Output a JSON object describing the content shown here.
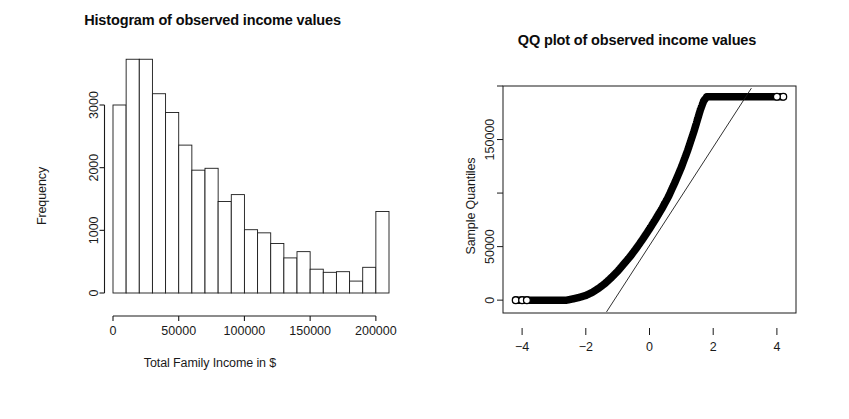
{
  "figure": {
    "background": "#ffffff",
    "foreground": "#111111",
    "panels": [
      "histogram",
      "qqplot"
    ]
  },
  "histogram": {
    "title": "Histogram of observed income values",
    "xlabel": "Total Family Income in $",
    "ylabel": "Frequency"
  },
  "qqplot": {
    "title": "QQ plot of observed income values",
    "xlabel": "Theoretical Quantiles",
    "ylabel": "Sample Quantiles"
  },
  "chart_data": [
    {
      "type": "bar",
      "id": "histogram",
      "title": "Histogram of observed income values",
      "xlabel": "Total Family Income in $",
      "ylabel": "Frequency",
      "grid": false,
      "legend": null,
      "xlim": [
        0,
        210000
      ],
      "ylim": [
        0,
        3800
      ],
      "xticks": [
        0,
        50000,
        100000,
        150000,
        200000
      ],
      "xticklabels": [
        "0",
        "50000",
        "100000",
        "150000",
        "200000"
      ],
      "yticks": [
        0,
        1000,
        2000,
        3000
      ],
      "yticklabels": [
        "0",
        "1000",
        "2000",
        "3000"
      ],
      "bin_width": 10000,
      "bin_edges": [
        0,
        10000,
        20000,
        30000,
        40000,
        50000,
        60000,
        70000,
        80000,
        90000,
        100000,
        110000,
        120000,
        130000,
        140000,
        150000,
        160000,
        170000,
        180000,
        190000,
        200000,
        210000
      ],
      "categories": [
        "0-10k",
        "10-20k",
        "20-30k",
        "30-40k",
        "40-50k",
        "50-60k",
        "60-70k",
        "70-80k",
        "80-90k",
        "90-100k",
        "100-110k",
        "110-120k",
        "120-130k",
        "130-140k",
        "140-150k",
        "150-160k",
        "160-170k",
        "170-180k",
        "180-190k",
        "190-200k",
        "200-210k"
      ],
      "values": [
        3000,
        3730,
        3730,
        3180,
        2880,
        2360,
        1960,
        1990,
        1460,
        1570,
        1010,
        960,
        790,
        560,
        660,
        380,
        330,
        340,
        190,
        410,
        1300
      ]
    },
    {
      "type": "scatter",
      "id": "qqplot",
      "title": "QQ plot of observed income values",
      "xlabel": "Theoretical Quantiles",
      "ylabel": "Sample Quantiles",
      "grid": false,
      "legend": null,
      "box": true,
      "xlim": [
        -4.6,
        4.6
      ],
      "ylim": [
        -12000,
        200000
      ],
      "xticks": [
        -4,
        -2,
        0,
        2,
        4
      ],
      "xticklabels": [
        "−4",
        "−2",
        "0",
        "2",
        "4"
      ],
      "yticks": [
        0,
        50000,
        100000,
        150000,
        200000
      ],
      "yticklabels": [
        "0",
        "50000",
        "",
        "150000",
        ""
      ],
      "reference_line": {
        "x": [
          -1.35,
          3.2
        ],
        "y": [
          -11000,
          198000
        ],
        "slope": 45900,
        "intercept": 50900
      },
      "series": [
        {
          "name": "Sample vs Theoretical quantiles",
          "marker": "open-circle",
          "x": [
            -4.2,
            -4.0,
            -3.8,
            -3.6,
            -3.4,
            -3.2,
            -3.0,
            -2.8,
            -2.6,
            -2.4,
            -2.2,
            -2.0,
            -1.8,
            -1.6,
            -1.4,
            -1.2,
            -1.0,
            -0.8,
            -0.6,
            -0.4,
            -0.2,
            0.0,
            0.2,
            0.4,
            0.6,
            0.8,
            1.0,
            1.2,
            1.4,
            1.5,
            1.6,
            1.7,
            1.8,
            2.0,
            2.4,
            2.8,
            3.2,
            3.6,
            4.0,
            4.2
          ],
          "y": [
            0,
            0,
            0,
            0,
            0,
            0,
            0,
            0,
            0,
            1200,
            2600,
            4400,
            7200,
            11000,
            15500,
            21000,
            27000,
            34000,
            41000,
            49000,
            57500,
            66500,
            76000,
            86000,
            97000,
            110000,
            124000,
            140000,
            158000,
            168000,
            178000,
            186000,
            190000,
            190000,
            190000,
            190000,
            190000,
            190000,
            190000,
            190000
          ]
        }
      ]
    }
  ]
}
